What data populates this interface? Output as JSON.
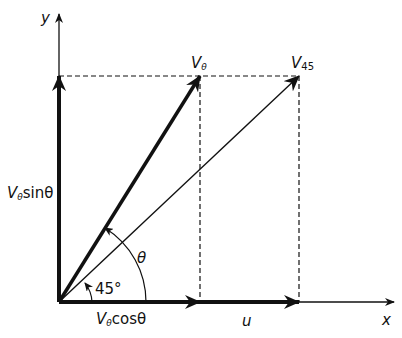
{
  "diagram": {
    "type": "vector-decomposition",
    "labels": {
      "y_axis": "y",
      "x_axis": "x",
      "v_theta_main": "V",
      "v_theta_sub": "θ",
      "v45_main": "V",
      "v45_sub": "45",
      "vertical_comp_main": "V",
      "vertical_comp_sub": "θ",
      "vertical_comp_rest": "sinθ",
      "horizontal_comp_main": "V",
      "horizontal_comp_sub": "θ",
      "horizontal_comp_rest": "cosθ",
      "u": "u",
      "theta_angle": "θ",
      "angle_45": "45°"
    },
    "colors": {
      "stroke": "#111111",
      "background": "#ffffff"
    }
  }
}
